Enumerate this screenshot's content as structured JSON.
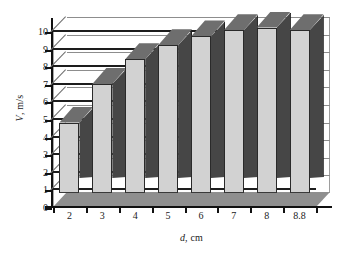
{
  "chart_data": {
    "type": "bar",
    "title": "",
    "subtitle": "",
    "xlabel": "d, cm",
    "xlabel_italic_part": "d",
    "xlabel_rest": ", cm",
    "ylabel": "V, m/s",
    "ylabel_italic_part": "V",
    "ylabel_rest": ", m/s",
    "categories": [
      "2",
      "3",
      "4",
      "5",
      "6",
      "7",
      "8",
      "8.8"
    ],
    "values": [
      4.0,
      6.2,
      7.6,
      8.4,
      8.9,
      9.25,
      9.4,
      9.25
    ],
    "series": [
      {
        "name": "V",
        "values": [
          4.0,
          6.2,
          7.6,
          8.4,
          8.9,
          9.25,
          9.4,
          9.25
        ]
      }
    ],
    "ylim": [
      0,
      10
    ],
    "xlim_categories": 8,
    "yticks": [
      0,
      1,
      2,
      3,
      4,
      5,
      6,
      7,
      8,
      9,
      10
    ],
    "ytick_labels": [
      "0",
      "1",
      "2",
      "3",
      "4",
      "5",
      "6",
      "7",
      "8",
      "9",
      "10"
    ],
    "grid": true,
    "grid_axis": "y",
    "legend": false,
    "legend_position": "none",
    "style": "3d-column",
    "annotations": [],
    "colors": {
      "bar_front": "#d2d2d2",
      "bar_side": "#464646",
      "bar_top": "#6e6e6e",
      "gridline": "#1d1d1d",
      "axis": "#111111",
      "floor": "#8f8f8f",
      "plot_background": "#ffffff",
      "text": "#1a1a1a"
    }
  }
}
